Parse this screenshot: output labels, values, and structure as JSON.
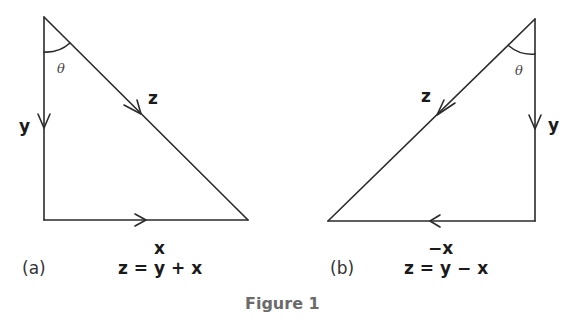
{
  "figure": {
    "caption": "Figure 1",
    "caption_color": "#6b6b6b",
    "panels": [
      {
        "id": "a",
        "panel_label": "(a)",
        "vectors": {
          "vertical": "y",
          "horizontal": "x",
          "hypotenuse": "z"
        },
        "angle_label": "θ",
        "equation": "z = y + x"
      },
      {
        "id": "b",
        "panel_label": "(b)",
        "vectors": {
          "vertical": "y",
          "horizontal": "−x",
          "hypotenuse": "z"
        },
        "angle_label": "θ",
        "equation": "z = y − x"
      }
    ]
  }
}
